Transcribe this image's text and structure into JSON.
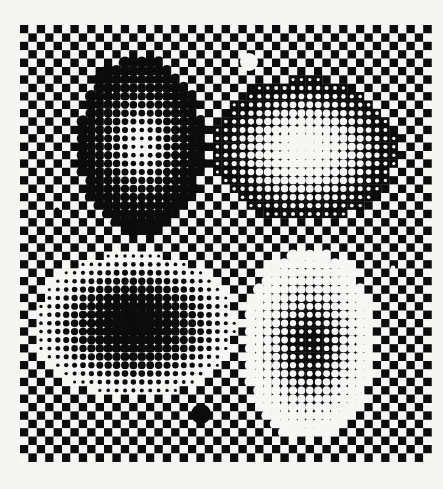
{
  "artwork": {
    "title": "Op-art checkerboard with halftone blobs",
    "canvas": {
      "width": 443,
      "height": 489,
      "paper_color": "#f4f4f2"
    },
    "colors": {
      "black": "#0c0c0c",
      "white": "#f6f6f4"
    },
    "grid": {
      "origin_x": 20,
      "origin_y": 25,
      "cell": 8.4,
      "cols": 49,
      "rows": 52,
      "top_left_black": true
    },
    "blobs": [
      {
        "name": "top-left-ring",
        "cx": 141,
        "cy": 145,
        "rx": 62,
        "ry": 88,
        "background": "white",
        "dot": "black",
        "r_edge": 0.78,
        "r_center": 0.18
      },
      {
        "name": "top-right-glow",
        "cx": 305,
        "cy": 150,
        "rx": 92,
        "ry": 72,
        "background": "black",
        "dot": "white",
        "r_edge": 0.18,
        "r_center": 0.8
      },
      {
        "name": "bottom-left-core",
        "cx": 135,
        "cy": 325,
        "rx": 100,
        "ry": 72,
        "background": "white",
        "dot": "black",
        "r_edge": 0.18,
        "r_center": 0.85
      },
      {
        "name": "bottom-right-ring",
        "cx": 310,
        "cy": 345,
        "rx": 65,
        "ry": 95,
        "background": "black",
        "dot": "white",
        "r_edge": 0.78,
        "r_center": 0.16
      }
    ],
    "accents": [
      {
        "name": "white-circle-top",
        "x": 249,
        "y": 62,
        "r": 9,
        "color": "white"
      },
      {
        "name": "black-circle-bottom",
        "x": 201,
        "y": 414,
        "r": 10,
        "color": "black"
      },
      {
        "name": "black-dot-left",
        "x": 57,
        "y": 210,
        "r": 2.6,
        "color": "black"
      },
      {
        "name": "white-dot-right",
        "x": 393,
        "y": 268,
        "r": 2.4,
        "color": "white"
      }
    ]
  }
}
